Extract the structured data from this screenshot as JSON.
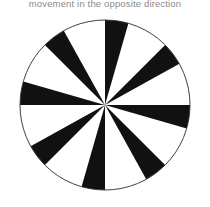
{
  "page": {
    "width": 210,
    "height": 207,
    "background_color": "#ffffff"
  },
  "caption": {
    "text": "movement in the opposite direction",
    "color": "#8a8a8a",
    "clipped_at_top": true
  },
  "figure": {
    "name": "pinwheel-illusion-disc",
    "center_x": 105,
    "center_y": 105,
    "radius": 85,
    "outline_color": "#2a2a2a",
    "outline_width": 0.9,
    "sector_count": 16,
    "black_color": "#111111",
    "white_color": "#ffffff",
    "sector_boundaries_deg": [
      0,
      16,
      45,
      61,
      90,
      106,
      135,
      151,
      180,
      196,
      225,
      241,
      270,
      286,
      315,
      331
    ],
    "sector_fills": [
      "black",
      "white",
      "black",
      "white",
      "black",
      "white",
      "black",
      "white",
      "black",
      "white",
      "black",
      "white",
      "black",
      "white",
      "black",
      "white"
    ]
  },
  "chart_data": {
    "type": "pie",
    "title": "",
    "xlabel": "",
    "ylabel": "",
    "legend": [],
    "grid": false,
    "categories": [
      "sector-1",
      "sector-2",
      "sector-3",
      "sector-4",
      "sector-5",
      "sector-6",
      "sector-7",
      "sector-8",
      "sector-9",
      "sector-10",
      "sector-11",
      "sector-12",
      "sector-13",
      "sector-14",
      "sector-15",
      "sector-16"
    ],
    "values": [
      16,
      29,
      16,
      29,
      16,
      29,
      16,
      29,
      16,
      29,
      16,
      29,
      16,
      29,
      16,
      29
    ],
    "start_angles_deg": [
      0,
      16,
      45,
      61,
      90,
      106,
      135,
      151,
      180,
      196,
      225,
      241,
      270,
      286,
      315,
      331
    ],
    "colors": [
      "#111111",
      "#ffffff",
      "#111111",
      "#ffffff",
      "#111111",
      "#ffffff",
      "#111111",
      "#ffffff",
      "#111111",
      "#ffffff",
      "#111111",
      "#ffffff",
      "#111111",
      "#ffffff",
      "#111111",
      "#ffffff"
    ],
    "units": "degrees",
    "total_degrees": 360,
    "note": "Unequal-width alternating radial sectors; boundaries coincide with the four cardinal directions (0, 90, 180, 270 degrees)."
  }
}
